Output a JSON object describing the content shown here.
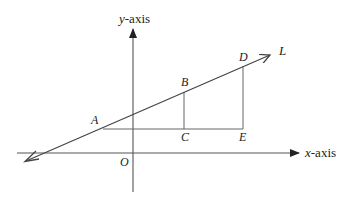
{
  "diagram": {
    "axes": {
      "x_label_var": "x",
      "x_label_suffix": "-axis",
      "y_label_var": "y",
      "y_label_suffix": "-axis",
      "origin_label": "O"
    },
    "line_label": "L",
    "points": {
      "A": "A",
      "B": "B",
      "C": "C",
      "D": "D",
      "E": "E"
    },
    "colors": {
      "axis": "#333333",
      "line": "#444444",
      "text": "#222222"
    }
  }
}
